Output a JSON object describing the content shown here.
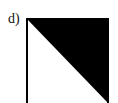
{
  "figure": {
    "label": "d)",
    "shape": "square split along diagonal (top-left to bottom-right)",
    "filled_region": "upper-right triangle",
    "colors": {
      "fill": "#000000",
      "background": "#ffffff",
      "border": "#000000"
    }
  }
}
